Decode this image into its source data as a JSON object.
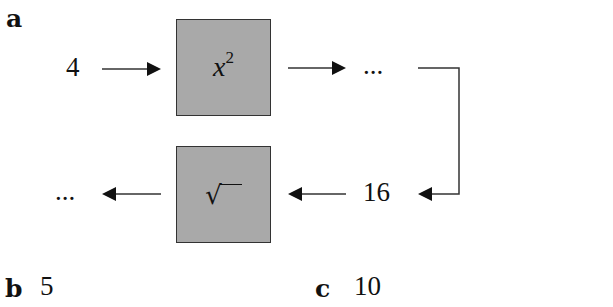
{
  "panels": {
    "a": {
      "label": "a",
      "input_value": "4",
      "square_box": {
        "operation_base": "x",
        "operation_exponent": "2"
      },
      "after_square": "...",
      "intermediate_value": "16",
      "sqrt_box": {
        "operation": "√"
      },
      "after_sqrt": "..."
    },
    "b": {
      "label": "b",
      "value": "5"
    },
    "c": {
      "label": "c",
      "value": "10"
    }
  },
  "colors": {
    "box_fill": "#a9a9a9",
    "box_border": "#333333",
    "line": "#333333"
  }
}
